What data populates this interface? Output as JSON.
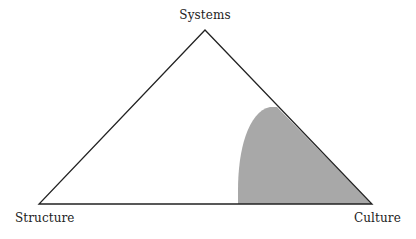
{
  "diagram": {
    "type": "triangle",
    "vertices": {
      "top": {
        "label": "Systems",
        "x": 205,
        "y": 30
      },
      "left": {
        "label": "Structure",
        "x": 39,
        "y": 204
      },
      "right": {
        "label": "Culture",
        "x": 372,
        "y": 204
      }
    },
    "shaded_region": {
      "description": "Curved shaded area near the Culture vertex",
      "fill": "#a8a8a8",
      "base_start_x": 238,
      "hypotenuse_meet": {
        "x": 277,
        "y": 107
      }
    },
    "colors": {
      "stroke": "#222222",
      "shade": "#a8a8a8",
      "background": "#ffffff"
    }
  }
}
